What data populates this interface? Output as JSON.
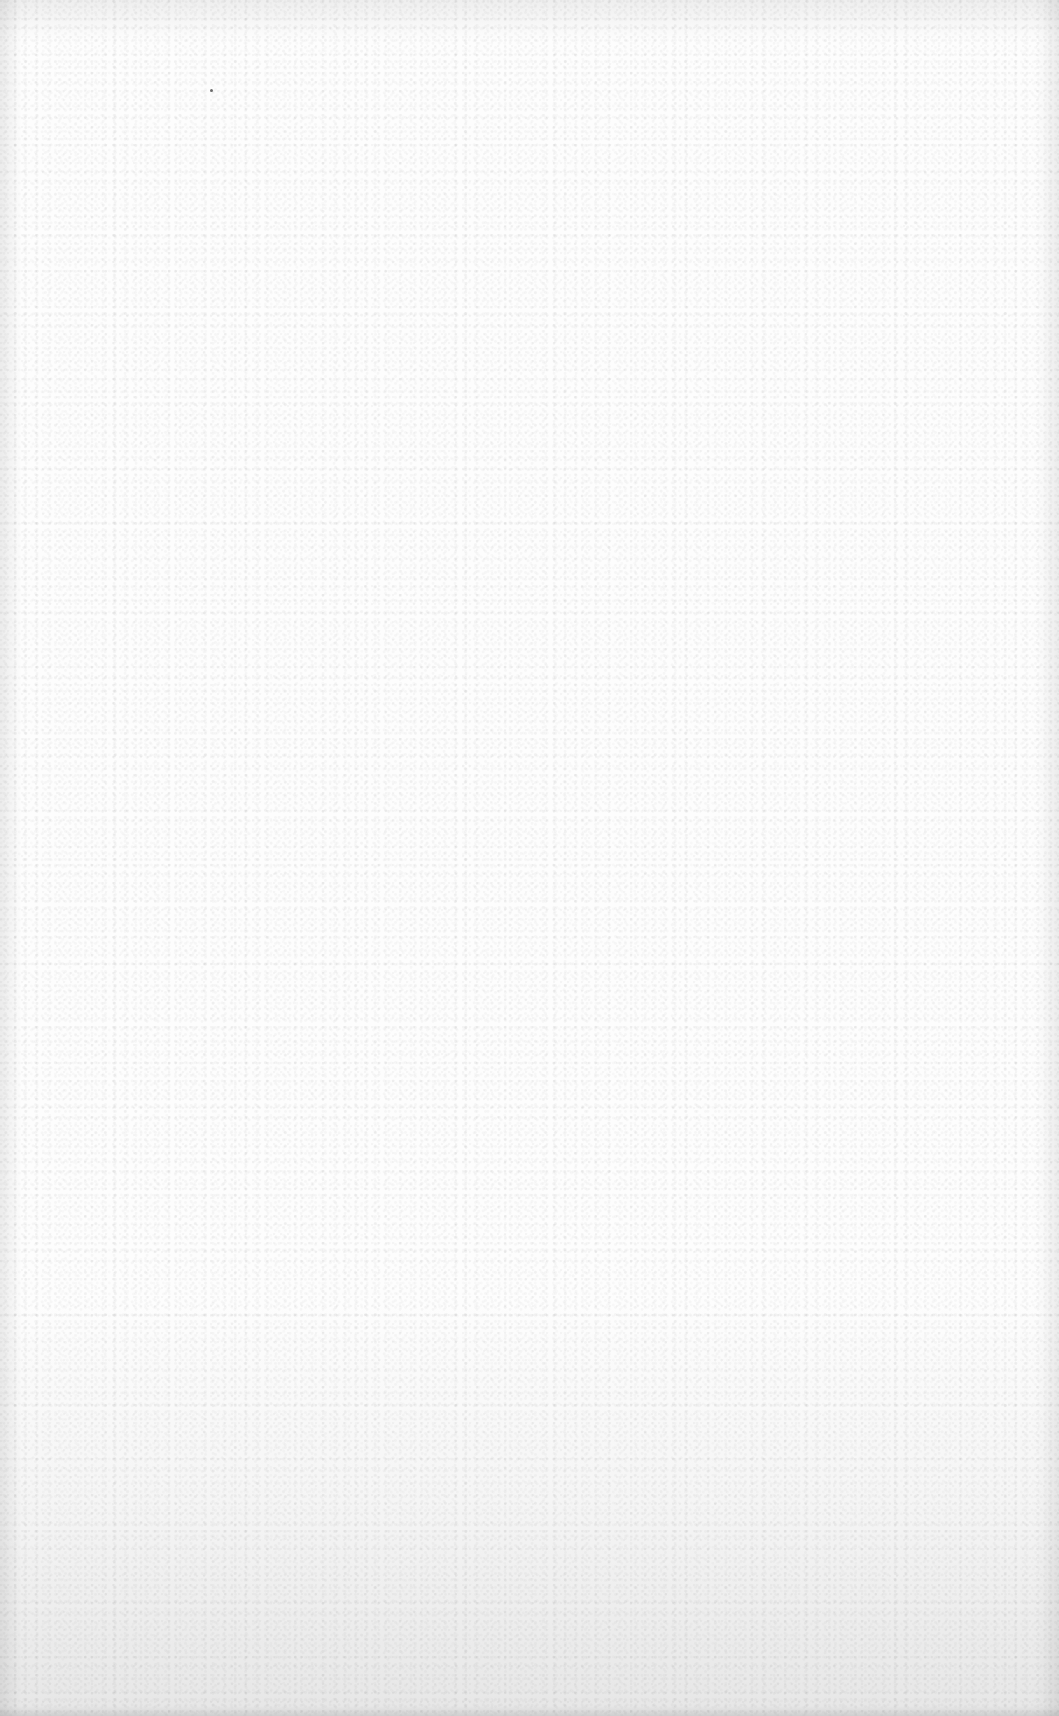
{
  "page": {
    "content_text": "",
    "colors": {
      "paper": "#fdfdfd",
      "speck": "#6b6b6b"
    }
  }
}
